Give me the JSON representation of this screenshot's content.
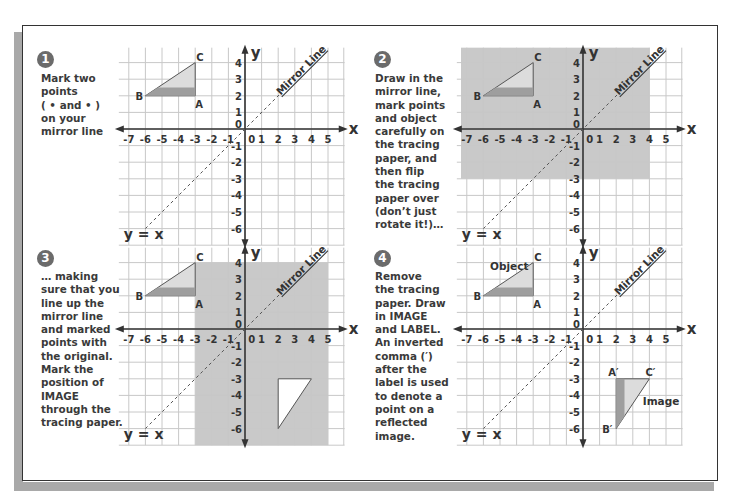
{
  "figure": {
    "colors": {
      "frame": "#333333",
      "shadow": "#a9a9a9",
      "badge": "#6b6b6b",
      "instruction_text": "#3a3a3a",
      "grid_line": "#c8c8c8",
      "axis": "#333333",
      "tracing_paper": "#c9c9c9",
      "triangle_light": "#dcdcdc",
      "triangle_dark": "#9e9e9e",
      "mirror_line": "#555555"
    },
    "axes": {
      "x_label": "x",
      "y_label": "y",
      "x_ticks": [
        "-7",
        "-6",
        "-5",
        "-4",
        "-3",
        "-2",
        "-1",
        "0",
        "1",
        "2",
        "3",
        "4",
        "5"
      ],
      "y_ticks": [
        "4",
        "3",
        "2",
        "1",
        "0",
        "-1",
        "-2",
        "-3",
        "-4",
        "-5",
        "-6"
      ],
      "mirror_line_label": "Mirror Line",
      "equation_label": "y = x"
    },
    "object": {
      "vertices": [
        {
          "label": "A",
          "x": -3,
          "y": 2
        },
        {
          "label": "B",
          "x": -6,
          "y": 2
        },
        {
          "label": "C",
          "x": -3,
          "y": 4
        }
      ]
    },
    "image": {
      "vertices": [
        {
          "label": "A′",
          "x": 2,
          "y": -3
        },
        {
          "label": "B′",
          "x": 2,
          "y": -6
        },
        {
          "label": "C′",
          "x": 4,
          "y": -3
        }
      ]
    },
    "panels": [
      {
        "number": "1",
        "instruction": "Mark two\npoints\n( • and • )\non your\nmirror line",
        "tracing_paper": null,
        "show_image_outline": false,
        "show_image_labeled": false,
        "object_label": ""
      },
      {
        "number": "2",
        "instruction": "Draw in the\nmirror line,\nmark points\nand object\ncarefully on\nthe tracing\npaper, and\nthen flip\nthe tracing\npaper over\n(don’t just\nrotate it!)…",
        "tracing_paper": {
          "x_min": -7,
          "x_max": 4,
          "y_min": -3,
          "y_max": 5
        },
        "show_image_outline": false,
        "show_image_labeled": false,
        "object_label": ""
      },
      {
        "number": "3",
        "instruction": "… making\nsure that you\nline up the\nmirror line\nand marked\npoints with\nthe original.\nMark the\nposition of\nIMAGE\nthrough the\ntracing paper.",
        "tracing_paper": {
          "x_min": -3,
          "x_max": 5,
          "y_min": -7,
          "y_max": 4
        },
        "show_image_outline": true,
        "show_image_labeled": false,
        "object_label": ""
      },
      {
        "number": "4",
        "instruction": "Remove\nthe tracing\npaper. Draw\nin IMAGE\nand LABEL.\nAn inverted\ncomma (′)\nafter the\nlabel is used\nto denote a\npoint on a\nreflected\nimage.",
        "tracing_paper": null,
        "show_image_outline": false,
        "show_image_labeled": true,
        "object_label": "Object",
        "image_label": "Image"
      }
    ]
  }
}
